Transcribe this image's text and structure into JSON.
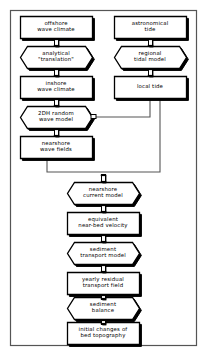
{
  "diagram": {
    "frame": {
      "border_color": "#555555",
      "x": 10,
      "y": 10,
      "width": 186,
      "height": 335
    },
    "style": {
      "fill": "#ffffff",
      "stroke": "#000000",
      "shadow": "#000000",
      "connector_fill": "#ffffff",
      "line_color": "#555555"
    },
    "legend": {
      "rectangle_meaning": "data / field",
      "octagon_meaning": "model / process"
    },
    "nodes": [
      {
        "id": "offshore-wave-climate",
        "shape": "rect",
        "lines": [
          "offshore",
          "wave climate"
        ],
        "x": 20,
        "y": 16,
        "width": 72,
        "height": 22,
        "column": "left"
      },
      {
        "id": "analytical-translation",
        "shape": "octagon",
        "lines": [
          "analytical",
          "\"translation\""
        ],
        "x": 20,
        "y": 46,
        "width": 72,
        "height": 22,
        "column": "left"
      },
      {
        "id": "inshore-wave-climate",
        "shape": "rect",
        "lines": [
          "inshore",
          "wave climate"
        ],
        "x": 20,
        "y": 76,
        "width": 72,
        "height": 22,
        "column": "left"
      },
      {
        "id": "2dh-random-wave-model",
        "shape": "octagon",
        "lines": [
          "2DH random",
          "wave model"
        ],
        "x": 20,
        "y": 106,
        "width": 72,
        "height": 22,
        "column": "left"
      },
      {
        "id": "nearshore-wave-fields",
        "shape": "rect",
        "lines": [
          "nearshore",
          "wave fields"
        ],
        "x": 20,
        "y": 136,
        "width": 72,
        "height": 22,
        "column": "left"
      },
      {
        "id": "astronomical-tide",
        "shape": "rect",
        "lines": [
          "astronomical",
          "tide"
        ],
        "x": 114,
        "y": 16,
        "width": 72,
        "height": 22,
        "column": "right"
      },
      {
        "id": "regional-tidal-model",
        "shape": "octagon",
        "lines": [
          "regional",
          "tidal model"
        ],
        "x": 114,
        "y": 46,
        "width": 72,
        "height": 22,
        "column": "right"
      },
      {
        "id": "local-tide",
        "shape": "rect",
        "lines": [
          "local tide"
        ],
        "x": 114,
        "y": 76,
        "width": 72,
        "height": 22,
        "column": "right"
      },
      {
        "id": "nearshore-current-model",
        "shape": "octagon",
        "lines": [
          "nearshore",
          "current model"
        ],
        "x": 67,
        "y": 182,
        "width": 72,
        "height": 22,
        "column": "center"
      },
      {
        "id": "equivalent-near-bed-velocity",
        "shape": "rect",
        "lines": [
          "equivalent",
          "near-bed velocity"
        ],
        "x": 67,
        "y": 212,
        "width": 72,
        "height": 22,
        "column": "center"
      },
      {
        "id": "sediment-transport-model",
        "shape": "octagon",
        "lines": [
          "sediment",
          "transport model"
        ],
        "x": 67,
        "y": 242,
        "width": 72,
        "height": 22,
        "column": "center"
      },
      {
        "id": "yearly-residual-transport-field",
        "shape": "rect",
        "lines": [
          "yearly residual",
          "transport field"
        ],
        "x": 67,
        "y": 272,
        "width": 72,
        "height": 22,
        "column": "center"
      },
      {
        "id": "sediment-balance",
        "shape": "octagon",
        "lines": [
          "sediment",
          "balance"
        ],
        "x": 67,
        "y": 297,
        "width": 72,
        "height": 22,
        "column": "center"
      },
      {
        "id": "initial-changes-of-bed-topography",
        "shape": "rect",
        "lines": [
          "initial changes of",
          "bed topography"
        ],
        "x": 67,
        "y": 322,
        "width": 72,
        "height": 22,
        "column": "center"
      }
    ],
    "connectors": [
      {
        "id": "c-offshore-to-analytical",
        "type": "ibeam",
        "x": 56,
        "y": 38,
        "length": 8
      },
      {
        "id": "c-analytical-to-inshore",
        "type": "ibeam",
        "x": 56,
        "y": 68,
        "length": 8
      },
      {
        "id": "c-inshore-to-2dh",
        "type": "ibeam",
        "x": 56,
        "y": 98,
        "length": 8
      },
      {
        "id": "c-2dh-to-nearshore-fields",
        "type": "ibeam",
        "x": 56,
        "y": 128,
        "length": 8
      },
      {
        "id": "c-astronomical-to-regional",
        "type": "ibeam",
        "x": 150,
        "y": 38,
        "length": 8
      },
      {
        "id": "c-regional-to-local",
        "type": "ibeam",
        "x": 150,
        "y": 68,
        "length": 8
      },
      {
        "id": "c-into-nearshore-current",
        "type": "ibeam",
        "x": 103,
        "y": 174,
        "length": 8
      },
      {
        "id": "c-current-to-velocity",
        "type": "ibeam",
        "x": 103,
        "y": 204,
        "length": 8
      },
      {
        "id": "c-velocity-to-transport-model",
        "type": "ibeam",
        "x": 103,
        "y": 234,
        "length": 8
      },
      {
        "id": "c-transport-model-to-field",
        "type": "ibeam",
        "x": 103,
        "y": 264,
        "length": 8
      },
      {
        "id": "c-field-to-balance",
        "type": "ibeam",
        "x": 103,
        "y": 294,
        "length": 5
      },
      {
        "id": "c-balance-to-initial-changes",
        "type": "ibeam",
        "x": 103,
        "y": 319,
        "length": 5
      }
    ],
    "routes": [
      {
        "id": "route-local-tide-to-2dh",
        "from": "local-tide",
        "to": "2dh-random-wave-model",
        "points": [
          [
            150,
            98
          ],
          [
            150,
            117
          ],
          [
            95,
            117
          ]
        ]
      },
      {
        "id": "route-local-tide-to-nearshore-current",
        "from": "local-tide",
        "to": "nearshore-current-model",
        "points": [
          [
            160,
            98
          ],
          [
            160,
            172
          ],
          [
            103,
            172
          ]
        ]
      },
      {
        "id": "route-wave-fields-to-nearshore-current",
        "from": "nearshore-wave-fields",
        "to": "nearshore-current-model",
        "points": [
          [
            47,
            158
          ],
          [
            47,
            172
          ],
          [
            103,
            172
          ]
        ]
      }
    ]
  }
}
